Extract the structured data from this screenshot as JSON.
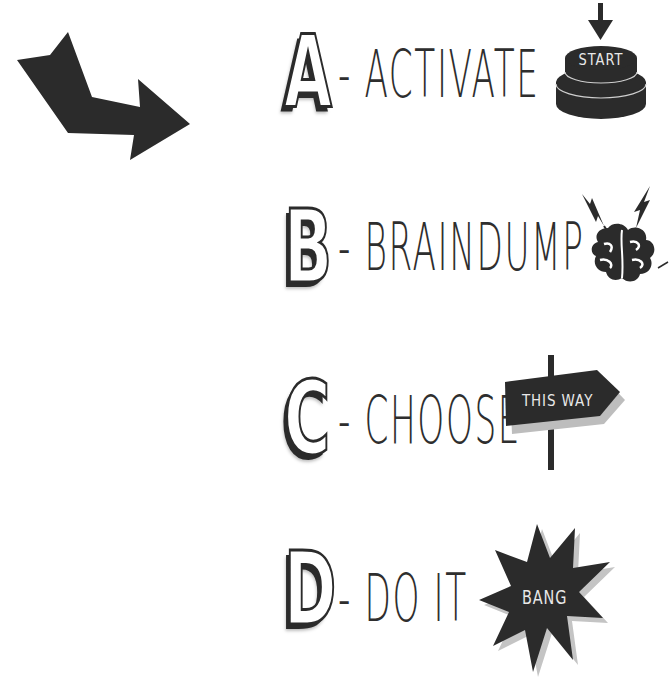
{
  "steps": [
    {
      "letter": "A",
      "label": "- ACTIVATE",
      "icon": "start-button-icon",
      "icon_text": "START"
    },
    {
      "letter": "B",
      "label": "- BRAINDUMP",
      "icon": "brain-lightning-icon",
      "icon_text": ""
    },
    {
      "letter": "C",
      "label": "- CHOOSE",
      "icon": "signpost-icon",
      "icon_text": "THIS WAY"
    },
    {
      "letter": "D",
      "label": "- DO IT",
      "icon": "starburst-icon",
      "icon_text": "BANG"
    }
  ],
  "decoration": {
    "arrow": "bent-arrow-icon"
  },
  "colors": {
    "ink": "#2b2b2b",
    "background": "#ffffff",
    "shadow": "#bdbdbd"
  }
}
